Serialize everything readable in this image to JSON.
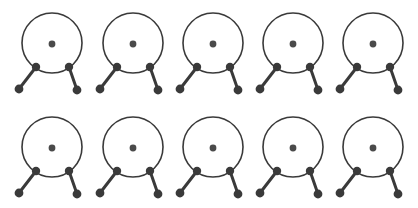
{
  "canvas": {
    "width": 418,
    "height": 208,
    "background": "#ffffff",
    "title": "Glyph Grid"
  },
  "style": {
    "stroke_color": "#3a3a3a",
    "node_fill": "#3a3a3a",
    "center_dot_fill": "#4a4a4a",
    "ring_stroke_width": 1.6,
    "leg_stroke_width": 3.0,
    "ring_radius": 30,
    "center_dot_radius": 3.4,
    "node_radius": 4.2,
    "foot_radius": 4.4
  },
  "layout": {
    "rows": 2,
    "columns": 5,
    "row_centers_y": [
      43,
      147
    ],
    "column_centers_x": [
      52,
      133,
      213,
      293,
      373
    ]
  },
  "glyph_template": {
    "name": "ring-with-two-legs",
    "ring": {
      "cx": 0,
      "cy": 0,
      "r": 30
    },
    "center_dot": {
      "cx": 0,
      "cy": 1,
      "r": 3.4
    },
    "left_node": {
      "cx": -16,
      "cy": 24,
      "r": 4.2
    },
    "right_node": {
      "cx": 17,
      "cy": 24,
      "r": 4.2
    },
    "left_foot": {
      "cx": -33,
      "cy": 46,
      "r": 4.4
    },
    "right_foot": {
      "cx": 25,
      "cy": 47,
      "r": 4.4
    }
  },
  "glyphs": [
    {
      "id": "glyph-r1-c1",
      "row": 1,
      "col": 1,
      "cx": 52,
      "cy": 43
    },
    {
      "id": "glyph-r1-c2",
      "row": 1,
      "col": 2,
      "cx": 133,
      "cy": 43
    },
    {
      "id": "glyph-r1-c3",
      "row": 1,
      "col": 3,
      "cx": 213,
      "cy": 43
    },
    {
      "id": "glyph-r1-c4",
      "row": 1,
      "col": 4,
      "cx": 293,
      "cy": 43
    },
    {
      "id": "glyph-r1-c5",
      "row": 1,
      "col": 5,
      "cx": 373,
      "cy": 43
    },
    {
      "id": "glyph-r2-c1",
      "row": 2,
      "col": 1,
      "cx": 52,
      "cy": 147
    },
    {
      "id": "glyph-r2-c2",
      "row": 2,
      "col": 2,
      "cx": 133,
      "cy": 147
    },
    {
      "id": "glyph-r2-c3",
      "row": 2,
      "col": 3,
      "cx": 213,
      "cy": 147
    },
    {
      "id": "glyph-r2-c4",
      "row": 2,
      "col": 4,
      "cx": 293,
      "cy": 147
    },
    {
      "id": "glyph-r2-c5",
      "row": 2,
      "col": 5,
      "cx": 373,
      "cy": 147
    }
  ]
}
